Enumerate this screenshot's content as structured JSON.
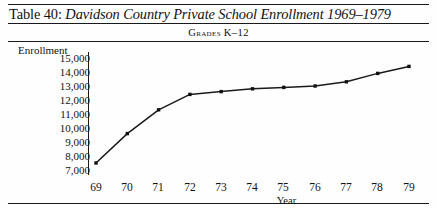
{
  "table": {
    "label": "Table 40:",
    "title": "Davidson Country Private School Enrollment 1969–1979",
    "subtitle": "Grades K–12"
  },
  "chart_data": {
    "type": "line",
    "title": "Davidson Country Private School Enrollment 1969–1979",
    "subtitle": "Grades K–12",
    "xlabel": "Year",
    "ylabel": "Enrollment",
    "categories": [
      "69",
      "70",
      "71",
      "72",
      "73",
      "74",
      "75",
      "76",
      "77",
      "78",
      "79"
    ],
    "x": [
      1969,
      1970,
      1971,
      1972,
      1973,
      1974,
      1975,
      1976,
      1977,
      1978,
      1979
    ],
    "values": [
      7500,
      9600,
      11300,
      12400,
      12600,
      12800,
      12900,
      13000,
      13300,
      13900,
      14400
    ],
    "ytick_labels": [
      "15,000",
      "14,000",
      "13,000",
      "12,000",
      "11,000",
      "10,000",
      "9,000",
      "8,000",
      "7,000"
    ],
    "ytick_values": [
      15000,
      14000,
      13000,
      12000,
      11000,
      10000,
      9000,
      8000,
      7000
    ],
    "ylim": [
      7000,
      15000
    ],
    "grid": false,
    "legend": "none",
    "marker": "square",
    "line_color": "#1a1a1a",
    "marker_color": "#111111"
  }
}
